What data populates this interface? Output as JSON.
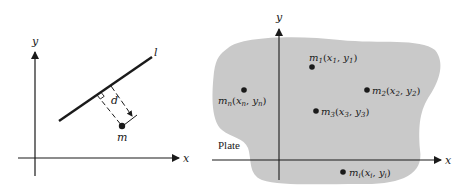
{
  "figure_left": {
    "axes": {
      "x_label": "x",
      "y_label": "y"
    },
    "line_label": "l",
    "distance_label": "d",
    "mass_label": "m",
    "right_angle_marker": true
  },
  "figure_right": {
    "axes": {
      "x_label": "x",
      "y_label": "y"
    },
    "region_label": "Plate",
    "plate_color": "#c9c9c9",
    "points": [
      {
        "id": "m1",
        "mass": "m",
        "sub": "1",
        "label_x": "x",
        "label_y": "y",
        "text": "m1(x1, y1)"
      },
      {
        "id": "m2",
        "mass": "m",
        "sub": "2",
        "text": "m2(x2, y2)"
      },
      {
        "id": "m3",
        "mass": "m",
        "sub": "3",
        "text": "m3(x3, y3)"
      },
      {
        "id": "mn",
        "mass": "m",
        "sub": "n",
        "text": "mn(xn, yn)"
      },
      {
        "id": "mi",
        "mass": "m",
        "sub": "i",
        "text": "mi(xi, yi)"
      }
    ]
  },
  "colors": {
    "ink": "#1a1a1a",
    "background": "#ffffff"
  }
}
